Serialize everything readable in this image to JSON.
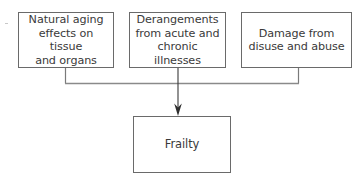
{
  "diagram": {
    "type": "flow",
    "causes": [
      {
        "id": "left",
        "label": "Natural aging\neffects on tissue\nand organs"
      },
      {
        "id": "center",
        "label": "Derangements\nfrom acute and\nchronic illnesses"
      },
      {
        "id": "right",
        "label": "Damage from\ndisuse and abuse"
      }
    ],
    "outcome": {
      "id": "target",
      "label": "Frailty"
    },
    "edges": [
      {
        "from": "left",
        "to": "target"
      },
      {
        "from": "center",
        "to": "target"
      },
      {
        "from": "right",
        "to": "target"
      }
    ],
    "colors": {
      "box_border": "#6a6a6a",
      "line": "#7a7a7a",
      "arrow": "#3a3a3a",
      "text": "#3a3a3a",
      "background": "#ffffff"
    }
  }
}
